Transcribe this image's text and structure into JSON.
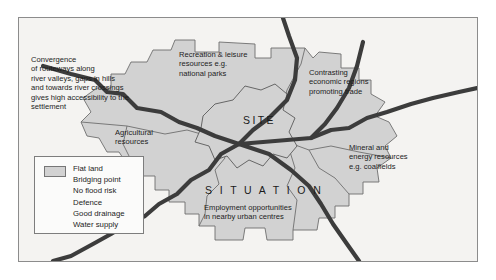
{
  "figure": {
    "type": "site-and-situation-map",
    "background_color": "#f4f3f1",
    "land_fill_color": "#d2d2d2",
    "road_color": "#3c3c3c",
    "border_color": "#8c8c8c"
  },
  "labels": {
    "site": "SITE",
    "situation": "S I T U A T I O N"
  },
  "annotations": [
    {
      "name": "convergence-note",
      "lines": [
        "Convergence",
        "of routeways along",
        "river valleys, gaps in hills",
        "and towards river crossings",
        "gives high accessibility to the",
        "settlement"
      ]
    },
    {
      "name": "recreation-note",
      "lines": [
        "Recreation & leisure",
        "resources e.g.",
        "national parks"
      ]
    },
    {
      "name": "economic-regions-note",
      "lines": [
        "Contrasting",
        "economic regions",
        "promoting trade"
      ]
    },
    {
      "name": "agricultural-note",
      "lines": [
        "Agricultural",
        "resources"
      ]
    },
    {
      "name": "mineral-energy-note",
      "lines": [
        "Mineral and",
        "energy resources",
        "e.g. coalfields"
      ]
    },
    {
      "name": "employment-note",
      "lines": [
        "Employment opportunities",
        "in nearby urban centres"
      ]
    }
  ],
  "legend": {
    "swatch_label": "Flat land",
    "items": [
      "Flat land",
      "Bridging point",
      "No flood risk",
      "Defence",
      "Good drainage",
      "Water supply"
    ]
  }
}
